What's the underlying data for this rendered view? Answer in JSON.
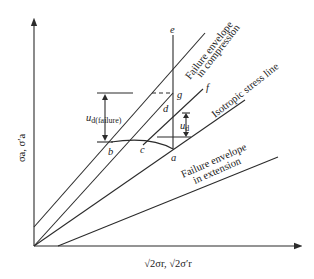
{
  "diagram": {
    "axes": {
      "y_label": "σa, σ′a",
      "x_label": "√2σr, √2σ′r"
    },
    "points": {
      "a": "a",
      "b": "b",
      "c": "c",
      "d": "d",
      "e": "e",
      "f": "f",
      "g": "g"
    },
    "lines": {
      "compression_envelope": "Failure envelope",
      "compression_envelope_2": "in compression",
      "isotropic": "Isotropic stress line",
      "extension_envelope": "Failure envelope",
      "extension_envelope_2": "in extension"
    },
    "dimensions": {
      "u_failure": "u",
      "u_failure_sub": "d(failure)",
      "u_d": "u",
      "u_d_sub": "d"
    }
  }
}
